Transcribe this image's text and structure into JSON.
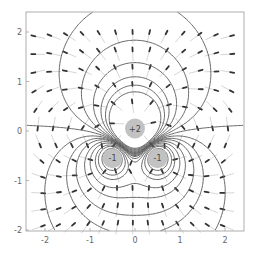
{
  "chart_data": {
    "type": "contour",
    "title": "",
    "xlabel": "",
    "ylabel": "",
    "xlim": [
      -2.4,
      2.4
    ],
    "ylim": [
      -2.2,
      2.4
    ],
    "x_ticks": [
      -2,
      -1,
      0,
      1,
      2
    ],
    "y_ticks": [
      -2,
      -1,
      0,
      1,
      2
    ],
    "x_tick_labels": [
      "-2",
      "-1",
      "0",
      "1",
      "2"
    ],
    "y_tick_labels": [
      "-2",
      "-1",
      "0",
      "1",
      "2"
    ],
    "grid": false,
    "charges": [
      {
        "q": 2,
        "x": 0.0,
        "y": 0.05,
        "label": "+2"
      },
      {
        "q": -1,
        "x": -0.5,
        "y": -0.55,
        "label": "-1"
      },
      {
        "q": -1,
        "x": 0.5,
        "y": -0.55,
        "label": "-1"
      }
    ],
    "equipotential_levels": [
      -3,
      -2,
      -1.5,
      -1,
      -0.7,
      -0.45,
      -0.3,
      -0.15,
      0,
      0.15,
      0.3,
      0.5,
      0.75,
      1.0,
      1.3
    ],
    "vector_grid_spacing": 0.35,
    "colors": {
      "contour": "#555555",
      "arrow_head": "#333333",
      "arrow_tail": "#cccccc",
      "charge_fill": "#bbbbbb",
      "frame": "#999999"
    }
  }
}
